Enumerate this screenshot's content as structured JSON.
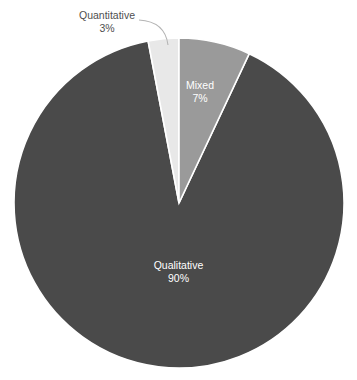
{
  "chart_data": {
    "type": "pie",
    "title": "",
    "subtitle": "",
    "xlabel": "",
    "ylabel": "",
    "legend_position": "none",
    "grid": false,
    "value_unit": "%",
    "start_angle_deg": 0,
    "direction": "clockwise",
    "categories": [
      "Qualitative",
      "Quantitative",
      "Mixed"
    ],
    "values": [
      90,
      3,
      7
    ],
    "labels": [
      "90%",
      "3%",
      "7%"
    ],
    "colors": [
      "#4a4a4a",
      "#e8e8e8",
      "#9a9a9a"
    ],
    "slices": [
      {
        "name": "Qualitative",
        "value": 90,
        "value_label": "90%",
        "color": "#4a4a4a",
        "label_placement": "inside",
        "label_color": "#ffffff"
      },
      {
        "name": "Quantitative",
        "value": 3,
        "value_label": "3%",
        "color": "#e8e8e8",
        "label_placement": "outside",
        "label_color": "#4f4f4f",
        "has_leader_line": true
      },
      {
        "name": "Mixed",
        "value": 7,
        "value_label": "7%",
        "color": "#9a9a9a",
        "label_placement": "inside",
        "label_color": "#ffffff"
      }
    ]
  },
  "geometry": {
    "center_x": 179,
    "center_y": 203,
    "radius": 165,
    "separator_color": "#ffffff",
    "separator_width": 1.6,
    "background": "#ffffff"
  },
  "labels": {
    "qualitative": {
      "name": "Qualitative",
      "value": "90%"
    },
    "quantitative": {
      "name": "Quantitative",
      "value": "3%"
    },
    "mixed": {
      "name": "Mixed",
      "value": "7%"
    }
  }
}
